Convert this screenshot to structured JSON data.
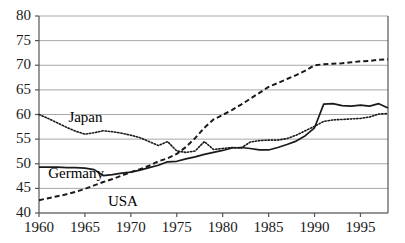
{
  "chart_data": {
    "type": "line",
    "title": "",
    "subtitle": "",
    "xlabel": "",
    "ylabel": "",
    "xlim": [
      1960,
      1998
    ],
    "ylim": [
      40,
      80
    ],
    "grid": "horizontal",
    "legend_position": "inline-annotations",
    "x_ticks": [
      "1960",
      "1965",
      "1970",
      "1975",
      "1980",
      "1985",
      "1990",
      "1995"
    ],
    "x_tick_values": [
      1960,
      1965,
      1970,
      1975,
      1980,
      1985,
      1990,
      1995
    ],
    "y_ticks": [
      "40",
      "45",
      "50",
      "55",
      "60",
      "65",
      "70",
      "75",
      "80"
    ],
    "y_tick_values": [
      40,
      45,
      50,
      55,
      60,
      65,
      70,
      75,
      80
    ],
    "x": [
      1960,
      1961,
      1962,
      1963,
      1964,
      1965,
      1966,
      1967,
      1968,
      1969,
      1970,
      1971,
      1972,
      1973,
      1974,
      1975,
      1976,
      1977,
      1978,
      1979,
      1980,
      1981,
      1982,
      1983,
      1984,
      1985,
      1986,
      1987,
      1988,
      1989,
      1990,
      1991,
      1992,
      1993,
      1994,
      1995,
      1996,
      1997,
      1998
    ],
    "series": [
      {
        "name": "Japan",
        "style": "dotted",
        "color": "#1a1a1a",
        "label_x": 1963.2,
        "label_y": 59.2,
        "values": [
          60.0,
          59.2,
          58.3,
          57.4,
          56.6,
          56.0,
          56.3,
          56.7,
          56.5,
          56.2,
          55.8,
          55.3,
          54.5,
          53.7,
          54.5,
          52.6,
          52.3,
          52.6,
          54.5,
          52.9,
          53.1,
          53.3,
          53.2,
          54.4,
          54.7,
          54.8,
          54.8,
          55.1,
          55.8,
          56.7,
          57.6,
          58.6,
          58.9,
          59.0,
          59.1,
          59.2,
          59.5,
          60.1,
          60.2
        ]
      },
      {
        "name": "Germany",
        "style": "solid",
        "color": "#1a1a1a",
        "label_x": 1961.0,
        "label_y": 48.0,
        "values": [
          49.3,
          49.3,
          49.3,
          49.2,
          49.2,
          49.1,
          48.8,
          47.6,
          47.8,
          48.1,
          48.3,
          48.7,
          49.2,
          49.7,
          50.4,
          50.5,
          51.0,
          51.4,
          51.9,
          52.3,
          52.7,
          53.2,
          53.3,
          53.1,
          52.8,
          52.8,
          53.3,
          53.9,
          54.6,
          55.7,
          57.3,
          62.1,
          62.2,
          61.8,
          61.7,
          61.9,
          61.7,
          62.2,
          61.3
        ]
      },
      {
        "name": "USA",
        "style": "dashed",
        "color": "#1a1a1a",
        "label_x": 1967.5,
        "label_y": 42.2,
        "values": [
          42.6,
          43.0,
          43.4,
          43.8,
          44.3,
          44.9,
          45.6,
          46.3,
          46.9,
          47.6,
          48.3,
          48.9,
          49.6,
          50.5,
          51.1,
          52.0,
          53.4,
          55.2,
          57.3,
          59.0,
          59.9,
          60.9,
          62.0,
          63.2,
          64.4,
          65.6,
          66.4,
          67.2,
          68.0,
          68.9,
          70.0,
          70.2,
          70.3,
          70.4,
          70.6,
          70.8,
          70.9,
          71.1,
          71.2
        ]
      }
    ]
  },
  "axes": {
    "y_axis_name": "value-axis",
    "x_axis_name": "year-axis"
  },
  "colors": {
    "ink": "#1a1a1a",
    "gridline": "#a8a8a8",
    "axis": "#555555",
    "background": "#ffffff"
  }
}
